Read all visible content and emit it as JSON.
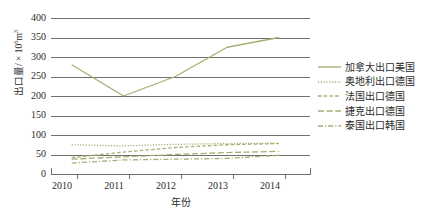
{
  "chart_data": {
    "type": "line",
    "title": "",
    "xlabel": "年份",
    "ylabel": "出口量/ × 10⁶m³",
    "ylabel_prefix": "出口量/ × 10",
    "ylabel_exp": "6",
    "ylabel_suffix": "m",
    "ylabel_suffix_exp": "3",
    "x": [
      2010,
      2011,
      2012,
      2013,
      2014
    ],
    "categories": [
      "2010",
      "2011",
      "2012",
      "2013",
      "2014"
    ],
    "xlim": [
      2009.6,
      2014.6
    ],
    "ylim": [
      0,
      400
    ],
    "yticks": [
      400,
      350,
      300,
      250,
      200,
      150,
      100,
      50,
      0
    ],
    "ytick_labels": [
      "400",
      "350",
      "300",
      "250",
      "200",
      "150",
      "100",
      "50",
      "0"
    ],
    "grid": "horizontal",
    "legend_position": "right",
    "series": [
      {
        "name": "加拿大出口美国",
        "values": [
          280,
          200,
          250,
          325,
          350
        ],
        "style": "solid",
        "color": "#a8ae72"
      },
      {
        "name": "奥地利出口德国",
        "values": [
          75,
          72,
          76,
          78,
          79
        ],
        "style": "dotted",
        "color": "#a8ae72"
      },
      {
        "name": "法国出口德国",
        "values": [
          42,
          56,
          68,
          75,
          78
        ],
        "style": "dashed",
        "color": "#a8ae72"
      },
      {
        "name": "捷克出口德国",
        "values": [
          38,
          44,
          50,
          55,
          58
        ],
        "style": "long-dash",
        "color": "#a8ae72"
      },
      {
        "name": "泰国出口韩国",
        "values": [
          28,
          36,
          38,
          40,
          48
        ],
        "style": "dash-dot",
        "color": "#a8ae72"
      }
    ]
  },
  "legend": {
    "items": [
      {
        "label": "加拿大出口美国",
        "style": "solid"
      },
      {
        "label": "奥地利出口德国",
        "style": "dotted"
      },
      {
        "label": "法国出口德国",
        "style": "dashed"
      },
      {
        "label": "捷克出口德国",
        "style": "long-dash"
      },
      {
        "label": "泰国出口韩国",
        "style": "dash-dot"
      }
    ]
  },
  "axes": {
    "y_title": "出口量/ × 10⁶m³",
    "x_title": "年份"
  },
  "colors": {
    "series": "#a8ae72",
    "grid": "#6f6f6f",
    "text": "#2b2b2b",
    "background": "#ffffff"
  },
  "top_caption": ""
}
